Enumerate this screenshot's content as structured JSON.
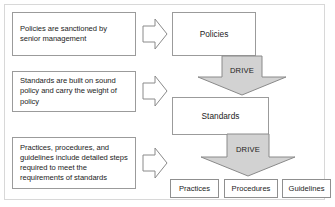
{
  "diagram": {
    "colors": {
      "box_border": "#9b9b9b",
      "frame_border": "#d8d8d8",
      "arrow_fill_gray": "#d2d2d2",
      "arrow_stroke": "#8a8a8a",
      "arrow_fill_white": "#ffffff",
      "text": "#1c1c1c",
      "background": "#ffffff"
    },
    "descriptions": [
      {
        "id": "policies-description",
        "lines": [
          "Policies are sanctioned by",
          "senior management"
        ],
        "text": "Policies are sanctioned by senior management"
      },
      {
        "id": "standards-description",
        "lines": [
          "Standards are built on sound",
          "policy and carry the weight",
          "of policy"
        ],
        "text": "Standards are built on sound policy and carry the weight of policy"
      },
      {
        "id": "practices-description",
        "lines": [
          "Practices, procedures, and",
          "guidelines include detailed",
          "steps required to meet the",
          "requirements of standards"
        ],
        "text": "Practices, procedures, and guidelines include detailed steps required to meet the requirements of standards"
      }
    ],
    "connectors_right": [
      {
        "id": "connector-to-policies",
        "icon": "arrow-right-icon"
      },
      {
        "id": "connector-to-standards",
        "icon": "arrow-right-icon"
      },
      {
        "id": "connector-to-practices",
        "icon": "arrow-right-icon"
      }
    ],
    "entities": [
      {
        "id": "policies-box",
        "label": "Policies"
      },
      {
        "id": "standards-box",
        "label": "Standards"
      }
    ],
    "drive_arrows": [
      {
        "id": "drive-arrow-policies-to-standards",
        "label": "DRIVE",
        "icon": "arrow-down-icon"
      },
      {
        "id": "drive-arrow-standards-to-practices",
        "label": "DRIVE",
        "icon": "arrow-down-icon"
      }
    ],
    "leaf_boxes": [
      {
        "id": "practices-box",
        "label": "Practices"
      },
      {
        "id": "procedures-box",
        "label": "Procedures"
      },
      {
        "id": "guidelines-box",
        "label": "Guidelines"
      }
    ]
  }
}
